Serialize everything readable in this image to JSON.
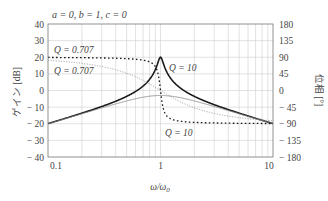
{
  "chart_data": {
    "type": "line",
    "title": "a = 0, b = 1, c = 0",
    "xlabel": "ω/ω0",
    "ylabel_left": "ゲイン [dB]",
    "ylabel_right": "位相 [°]",
    "xscale": "log",
    "xlim": [
      0.1,
      10
    ],
    "ylim_left": [
      -40,
      40
    ],
    "ylim_right": [
      -180,
      180
    ],
    "x_ticks": [
      "0.1",
      "1",
      "10"
    ],
    "y_ticks_left": [
      "40",
      "30",
      "20",
      "10",
      "0",
      "-10",
      "-20",
      "-30",
      "-40"
    ],
    "y_ticks_right": [
      "180",
      "135",
      "90",
      "45",
      "0",
      "-45",
      "-90",
      "-135",
      "-180"
    ],
    "grid": true,
    "series": [
      {
        "name": "Gain Q=10",
        "axis": "left",
        "style": "solid-thick",
        "Q": 10,
        "x": [
          0.1,
          0.3,
          0.5,
          0.8,
          0.9,
          1.0,
          1.1,
          1.25,
          2,
          3.3,
          10
        ],
        "values": [
          -20,
          -10.5,
          -5.6,
          1.9,
          6.6,
          20,
          7.6,
          2.4,
          -5.6,
          -10.2,
          -20
        ]
      },
      {
        "name": "Gain Q=0.707",
        "axis": "left",
        "style": "solid-thin",
        "Q": 0.707,
        "x": [
          0.1,
          0.3,
          0.5,
          1.0,
          2,
          3.3,
          10
        ],
        "values": [
          -20,
          -10.9,
          -7,
          -3,
          -7,
          -10.7,
          -20
        ]
      },
      {
        "name": "Phase Q=10",
        "axis": "right",
        "style": "dotted-thick",
        "Q": 10,
        "x": [
          0.1,
          0.5,
          0.9,
          1.0,
          1.1,
          2,
          10
        ],
        "values": [
          89.9,
          87.7,
          62.2,
          0,
          -62.3,
          -87.7,
          -89.9
        ]
      },
      {
        "name": "Phase Q=0.707",
        "axis": "right",
        "style": "dotted-thin",
        "Q": 0.707,
        "x": [
          0.1,
          0.3,
          0.5,
          1.0,
          2,
          3.3,
          10
        ],
        "values": [
          81.9,
          65,
          43.3,
          0,
          -43.3,
          -65.4,
          -81.9
        ]
      }
    ],
    "annotations": [
      {
        "text": "Q = 0.707",
        "target": "phase Q=0.707 (upper label)"
      },
      {
        "text": "Q = 0.707",
        "target": "gain/phase Q=0.707 (lower label)"
      },
      {
        "text": "Q = 10",
        "target": "gain peak Q=10"
      },
      {
        "text": "Q = 10",
        "target": "phase Q=10"
      }
    ]
  },
  "labels": {
    "title": "a = 0, b = 1, c = 0",
    "xlabel_main": "ω/ω",
    "xlabel_sub": "0",
    "ylabel_left": "ゲイン [dB]",
    "ylabel_right": "位相 [°]",
    "q707_upper": "Q = 0.707",
    "q707_lower": "Q = 0.707",
    "q10_gain": "Q = 10",
    "q10_phase": "Q = 10"
  },
  "colors": {
    "grid": "#cfcfcf",
    "frame": "#777777",
    "curve_dark": "#1a1a1a",
    "curve_light": "#8a8a8a",
    "text": "#444444"
  }
}
